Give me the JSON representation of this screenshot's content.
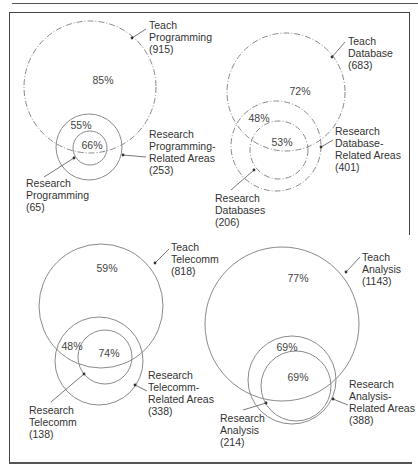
{
  "diagrams": [
    {
      "id": "programming",
      "circles": {
        "teach": {
          "cx": 90,
          "cy": 87,
          "r": 66,
          "dash": "6 2 1 2"
        },
        "related": {
          "cx": 89,
          "cy": 147,
          "r": 33,
          "dash": ""
        },
        "research": {
          "cx": 90,
          "cy": 148,
          "r": 17,
          "dash": ""
        }
      },
      "percents": {
        "teach": {
          "text": "85%",
          "x": 103,
          "y": 80
        },
        "related": {
          "text": "55%",
          "x": 81,
          "y": 125
        },
        "research": {
          "text": "66%",
          "x": 92,
          "y": 145
        }
      },
      "labels": {
        "teach": {
          "lines": [
            "Teach",
            "Programming",
            "(915)"
          ],
          "x": 149,
          "y": 19
        },
        "related": {
          "lines": [
            "Research",
            "Programming-",
            "Related Areas",
            "(253)"
          ],
          "x": 149,
          "y": 128
        },
        "research": {
          "lines": [
            "Research",
            "Programming",
            "(65)"
          ],
          "x": 26,
          "y": 177
        }
      },
      "arrows": [
        {
          "x1": 146,
          "y1": 29,
          "x2": 132,
          "y2": 38
        },
        {
          "x1": 146,
          "y1": 157,
          "x2": 123,
          "y2": 155
        },
        {
          "x1": 44,
          "y1": 177,
          "x2": 74,
          "y2": 158
        }
      ]
    },
    {
      "id": "database",
      "circles": {
        "teach": {
          "cx": 286,
          "cy": 92,
          "r": 59,
          "dash": "6 2 1 2"
        },
        "related": {
          "cx": 276,
          "cy": 146,
          "r": 45,
          "dash": "6 2 1 2"
        },
        "research": {
          "cx": 279,
          "cy": 150,
          "r": 29,
          "dash": "6 2 1 2"
        }
      },
      "percents": {
        "teach": {
          "text": "72%",
          "x": 300,
          "y": 91
        },
        "related": {
          "text": "48%",
          "x": 259,
          "y": 118
        },
        "research": {
          "text": "53%",
          "x": 282,
          "y": 142
        }
      },
      "labels": {
        "teach": {
          "lines": [
            "Teach",
            "Database",
            "(683)"
          ],
          "x": 348,
          "y": 35
        },
        "related": {
          "lines": [
            "Research",
            "Database-",
            "Related Areas",
            "(401)"
          ],
          "x": 335,
          "y": 125
        },
        "research": {
          "lines": [
            "Research",
            "Databases",
            "(206)"
          ],
          "x": 215,
          "y": 192
        }
      },
      "arrows": [
        {
          "x1": 345,
          "y1": 42,
          "x2": 332,
          "y2": 57
        },
        {
          "x1": 333,
          "y1": 140,
          "x2": 321,
          "y2": 147
        },
        {
          "x1": 231,
          "y1": 190,
          "x2": 254,
          "y2": 170
        }
      ]
    },
    {
      "id": "telecomm",
      "circles": {
        "teach": {
          "cx": 101,
          "cy": 306,
          "r": 62,
          "dash": ""
        },
        "related": {
          "cx": 99,
          "cy": 361,
          "r": 44,
          "dash": ""
        },
        "research": {
          "cx": 105,
          "cy": 357,
          "r": 27,
          "dash": ""
        }
      },
      "percents": {
        "teach": {
          "text": "59%",
          "x": 107,
          "y": 268
        },
        "related": {
          "text": "48%",
          "x": 72,
          "y": 346
        },
        "research": {
          "text": "74%",
          "x": 109,
          "y": 353
        }
      },
      "labels": {
        "teach": {
          "lines": [
            "Teach",
            "Telecomm",
            "(818)"
          ],
          "x": 171,
          "y": 241
        },
        "related": {
          "lines": [
            "Research",
            "Telecomm-",
            "Related Areas",
            "(338)"
          ],
          "x": 148,
          "y": 369
        },
        "research": {
          "lines": [
            "Research",
            "Telecomm",
            "(138)"
          ],
          "x": 29,
          "y": 404
        }
      },
      "arrows": [
        {
          "x1": 169,
          "y1": 249,
          "x2": 155,
          "y2": 263
        },
        {
          "x1": 147,
          "y1": 391,
          "x2": 135,
          "y2": 385
        },
        {
          "x1": 51,
          "y1": 402,
          "x2": 84,
          "y2": 374
        }
      ]
    },
    {
      "id": "analysis",
      "circles": {
        "teach": {
          "cx": 282,
          "cy": 324,
          "r": 77,
          "dash": ""
        },
        "related": {
          "cx": 292,
          "cy": 380,
          "r": 44,
          "dash": ""
        },
        "research": {
          "cx": 296,
          "cy": 386,
          "r": 35,
          "dash": ""
        }
      },
      "percents": {
        "teach": {
          "text": "77%",
          "x": 298,
          "y": 278
        },
        "related": {
          "text": "69%",
          "x": 287,
          "y": 347
        },
        "research": {
          "text": "69%",
          "x": 298,
          "y": 377
        }
      },
      "labels": {
        "teach": {
          "lines": [
            "Teach",
            "Analysis",
            "(1143)"
          ],
          "x": 362,
          "y": 251
        },
        "related": {
          "lines": [
            "Research",
            "Analysis-",
            "Related Areas",
            "(388)"
          ],
          "x": 349,
          "y": 378
        },
        "research": {
          "lines": [
            "Research",
            "Analysis",
            "(214)"
          ],
          "x": 220,
          "y": 412
        }
      },
      "arrows": [
        {
          "x1": 360,
          "y1": 257,
          "x2": 346,
          "y2": 272
        },
        {
          "x1": 348,
          "y1": 405,
          "x2": 333,
          "y2": 399
        },
        {
          "x1": 243,
          "y1": 410,
          "x2": 266,
          "y2": 403
        }
      ]
    }
  ],
  "styles": {
    "stroke": "#8a8a8a",
    "arrow_stroke": "#555555",
    "text": "#333333"
  }
}
